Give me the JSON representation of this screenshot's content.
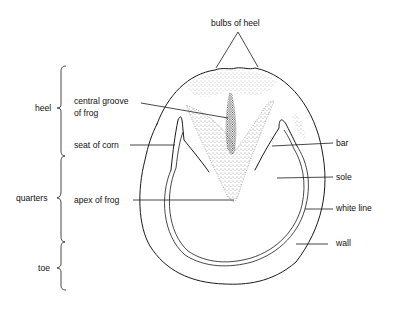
{
  "diagram": {
    "regions": [
      {
        "id": "heel",
        "label": "heel"
      },
      {
        "id": "quarters",
        "label": "quarters"
      },
      {
        "id": "toe",
        "label": "toe"
      }
    ],
    "labels": {
      "bulbs_of_heel": "bulbs of heel",
      "central_groove_line1": "central groove",
      "central_groove_line2": "of frog",
      "seat_of_corn": "seat of corn",
      "apex_of_frog": "apex of frog",
      "bar": "bar",
      "sole": "sole",
      "white_line": "white line",
      "wall": "wall"
    },
    "colors": {
      "ink": "#1a1a1a",
      "background": "#ffffff"
    }
  }
}
